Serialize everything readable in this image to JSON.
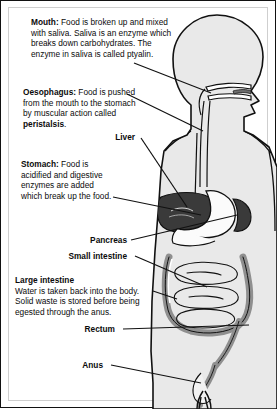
{
  "diagram": {
    "colors": {
      "ink": "#111111",
      "body_fill": "#e9e9e9",
      "organ_dark": "#3a3a3a",
      "organ_mid": "#8f8f8f",
      "organ_light": "#f2f2f2",
      "frame": "#cfcfcf"
    },
    "labels": [
      {
        "id": "mouth",
        "heading": "Mouth:",
        "text": " Food is broken up and mixed with saliva. Saliva is an enzyme which breaks down carbohydrates. The enzyme in saliva is called ptyalin.",
        "style": "paragraph"
      },
      {
        "id": "oesophagus",
        "heading": "Oesophagus:",
        "text": " Food is pushed from the mouth to the stomach by muscular action called ",
        "emphasis": "peristalsis",
        "tail": ".",
        "style": "paragraph"
      },
      {
        "id": "liver",
        "heading": "Liver",
        "text": "",
        "style": "callout"
      },
      {
        "id": "stomach",
        "heading": "Stomach:",
        "text": " Food is acidified and digestive enzymes are added which break up the food.",
        "style": "paragraph"
      },
      {
        "id": "pancreas",
        "heading": "Pancreas",
        "text": "",
        "style": "callout"
      },
      {
        "id": "small-intestine",
        "heading": "Small intestine",
        "text": "",
        "style": "callout"
      },
      {
        "id": "large-intestine",
        "heading": "Large intestine",
        "text": "Water is taken back into the body. Solid waste is stored before being egested through the anus.",
        "style": "paragraph-blockhead"
      },
      {
        "id": "rectum",
        "heading": "Rectum",
        "text": "",
        "style": "callout"
      },
      {
        "id": "anus",
        "heading": "Anus",
        "text": "",
        "style": "callout"
      }
    ],
    "organs": [
      "head",
      "oral-cavity",
      "oesophagus-tube",
      "liver",
      "stomach",
      "spleen",
      "pancreas",
      "small-intestine",
      "large-intestine",
      "rectum",
      "anus"
    ]
  }
}
